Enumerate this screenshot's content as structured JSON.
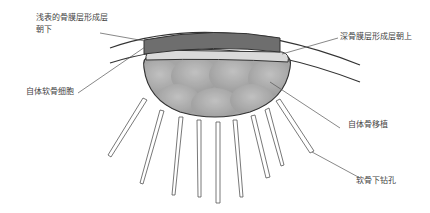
{
  "diagram": {
    "type": "cartilage repair schematic (periosteum cover over autologous bone graft with subchondral drilling)",
    "labels": {
      "superficial_periosteum": [
        "浅表的骨膜层形成层",
        "朝下"
      ],
      "deep_periosteum": "深骨膜层形成层朝上",
      "chondrocytes": "自体软骨细胞",
      "bone_graft": "自体骨移植",
      "subchondral_drilling": "软骨下钻孔"
    },
    "colors": {
      "periosteum_top": "#6e6e6e",
      "periosteum_light": "#d8d8d8",
      "graft_fill": "#a9a9a9",
      "graft_lobes": "#bdbdbd",
      "outline": "#333333",
      "drill_holes": "#ffffff",
      "leader_lines": "#555555"
    },
    "drill_hole_count": 9
  }
}
